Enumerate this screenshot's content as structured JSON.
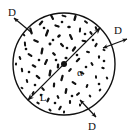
{
  "figure": {
    "type": "technical-diagram",
    "background_color": "#ffffff",
    "stroke_color": "#111111"
  },
  "circle": {
    "name": "specimen-cross-section",
    "center_x": 64,
    "center_y": 64,
    "radius": 51,
    "stroke_width": 1.4
  },
  "diagonal": {
    "name": "diameter-line",
    "label": "L",
    "x1": 27.9,
    "y1": 100.1,
    "x2": 100.1,
    "y2": 27.9,
    "angle_deg": 45,
    "arrowheads": "both"
  },
  "center_dot": {
    "name": "center-point",
    "radius": 3
  },
  "labels": {
    "diameter_label": "L",
    "angle_label": "α",
    "callout_top_left": "D",
    "callout_top_right": "D",
    "callout_bottom_right": "D"
  },
  "callouts": [
    {
      "id": "callout-top-left",
      "label": "D",
      "label_x": 12,
      "label_y": 16,
      "arrow_x1": 14,
      "arrow_y1": 18,
      "arrow_x2": 32,
      "arrow_y2": 33,
      "double_headed": false
    },
    {
      "id": "callout-top-right",
      "label": "D",
      "label_x": 118,
      "label_y": 34,
      "arrow_x1": 103,
      "arrow_y1": 48,
      "arrow_x2": 127,
      "arrow_y2": 39,
      "double_headed": true
    },
    {
      "id": "callout-bottom-right",
      "label": "D",
      "label_x": 92,
      "label_y": 130,
      "arrow_x1": 80,
      "arrow_y1": 100,
      "arrow_x2": 96,
      "arrow_y2": 117,
      "double_headed": true
    }
  ],
  "fibers": {
    "name": "scattered-fiber-marks",
    "count": 84,
    "color": "#111111",
    "marks": [
      {
        "x": 52,
        "y": 17,
        "len": 6.5,
        "w": 2.2,
        "a": 62
      },
      {
        "x": 64,
        "y": 16,
        "len": 5.0,
        "w": 2.0,
        "a": 15
      },
      {
        "x": 75,
        "y": 18,
        "len": 6.0,
        "w": 2.4,
        "a": 105
      },
      {
        "x": 86,
        "y": 22,
        "len": 4.5,
        "w": 2.0,
        "a": 40
      },
      {
        "x": 41,
        "y": 23,
        "len": 6.0,
        "w": 2.2,
        "a": 130
      },
      {
        "x": 31,
        "y": 31,
        "len": 7.0,
        "w": 2.3,
        "a": 75
      },
      {
        "x": 57,
        "y": 26,
        "len": 5.5,
        "w": 2.1,
        "a": 20
      },
      {
        "x": 69,
        "y": 27,
        "len": 3.5,
        "w": 2.6,
        "a": 0
      },
      {
        "x": 80,
        "y": 30,
        "len": 5.0,
        "w": 2.0,
        "a": 95
      },
      {
        "x": 91,
        "y": 33,
        "len": 4.0,
        "w": 2.2,
        "a": 55
      },
      {
        "x": 47,
        "y": 33,
        "len": 7.5,
        "w": 2.4,
        "a": 110
      },
      {
        "x": 36,
        "y": 41,
        "len": 6.0,
        "w": 2.2,
        "a": 25
      },
      {
        "x": 25,
        "y": 44,
        "len": 5.0,
        "w": 2.0,
        "a": 85
      },
      {
        "x": 59,
        "y": 36,
        "len": 4.0,
        "w": 2.6,
        "a": 140
      },
      {
        "x": 71,
        "y": 37,
        "len": 6.5,
        "w": 2.2,
        "a": 65
      },
      {
        "x": 84,
        "y": 41,
        "len": 5.0,
        "w": 2.1,
        "a": 10
      },
      {
        "x": 96,
        "y": 45,
        "len": 4.5,
        "w": 2.2,
        "a": 120
      },
      {
        "x": 50,
        "y": 44,
        "len": 3.0,
        "w": 2.8,
        "a": 0
      },
      {
        "x": 42,
        "y": 51,
        "len": 7.0,
        "w": 2.3,
        "a": 100
      },
      {
        "x": 30,
        "y": 55,
        "len": 5.5,
        "w": 2.1,
        "a": 35
      },
      {
        "x": 20,
        "y": 58,
        "len": 4.0,
        "w": 2.0,
        "a": 70
      },
      {
        "x": 62,
        "y": 45,
        "len": 5.0,
        "w": 2.2,
        "a": 50
      },
      {
        "x": 74,
        "y": 49,
        "len": 6.0,
        "w": 2.3,
        "a": 125
      },
      {
        "x": 88,
        "y": 52,
        "len": 4.0,
        "w": 2.1,
        "a": 15
      },
      {
        "x": 99,
        "y": 57,
        "len": 3.5,
        "w": 2.0,
        "a": 90
      },
      {
        "x": 54,
        "y": 54,
        "len": 4.5,
        "w": 2.4,
        "a": 45
      },
      {
        "x": 46,
        "y": 62,
        "len": 6.5,
        "w": 2.2,
        "a": 115
      },
      {
        "x": 34,
        "y": 66,
        "len": 5.0,
        "w": 2.1,
        "a": 30
      },
      {
        "x": 22,
        "y": 70,
        "len": 4.5,
        "w": 2.0,
        "a": 80
      },
      {
        "x": 66,
        "y": 58,
        "len": 3.0,
        "w": 2.6,
        "a": 0
      },
      {
        "x": 78,
        "y": 60,
        "len": 5.5,
        "w": 2.2,
        "a": 135
      },
      {
        "x": 92,
        "y": 64,
        "len": 4.0,
        "w": 2.1,
        "a": 60
      },
      {
        "x": 103,
        "y": 68,
        "len": 3.5,
        "w": 2.0,
        "a": 20
      },
      {
        "x": 58,
        "y": 66,
        "len": 5.0,
        "w": 2.3,
        "a": 95
      },
      {
        "x": 50,
        "y": 73,
        "len": 7.0,
        "w": 2.4,
        "a": 100
      },
      {
        "x": 38,
        "y": 77,
        "len": 5.5,
        "w": 2.2,
        "a": 40
      },
      {
        "x": 27,
        "y": 81,
        "len": 4.0,
        "w": 2.0,
        "a": 75
      },
      {
        "x": 70,
        "y": 70,
        "len": 4.5,
        "w": 2.2,
        "a": 130
      },
      {
        "x": 82,
        "y": 73,
        "len": 5.0,
        "w": 2.1,
        "a": 25
      },
      {
        "x": 96,
        "y": 77,
        "len": 3.5,
        "w": 2.0,
        "a": 85
      },
      {
        "x": 62,
        "y": 78,
        "len": 6.5,
        "w": 2.3,
        "a": 105
      },
      {
        "x": 54,
        "y": 85,
        "len": 5.0,
        "w": 2.2,
        "a": 95
      },
      {
        "x": 43,
        "y": 89,
        "len": 4.5,
        "w": 2.1,
        "a": 50
      },
      {
        "x": 33,
        "y": 93,
        "len": 4.0,
        "w": 2.0,
        "a": 120
      },
      {
        "x": 74,
        "y": 83,
        "len": 5.5,
        "w": 2.2,
        "a": 35
      },
      {
        "x": 87,
        "y": 86,
        "len": 4.0,
        "w": 2.1,
        "a": 110
      },
      {
        "x": 66,
        "y": 91,
        "len": 6.0,
        "w": 2.3,
        "a": 100
      },
      {
        "x": 58,
        "y": 97,
        "len": 4.0,
        "w": 2.1,
        "a": 65
      },
      {
        "x": 48,
        "y": 100,
        "len": 5.0,
        "w": 2.2,
        "a": 115
      },
      {
        "x": 38,
        "y": 103,
        "len": 3.5,
        "w": 2.0,
        "a": 30
      },
      {
        "x": 78,
        "y": 94,
        "len": 4.5,
        "w": 2.2,
        "a": 140
      },
      {
        "x": 90,
        "y": 96,
        "len": 3.0,
        "w": 2.0,
        "a": 55
      },
      {
        "x": 70,
        "y": 102,
        "len": 4.0,
        "w": 2.1,
        "a": 90
      },
      {
        "x": 60,
        "y": 108,
        "len": 5.0,
        "w": 2.2,
        "a": 120
      },
      {
        "x": 50,
        "y": 110,
        "len": 3.5,
        "w": 2.0,
        "a": 45
      },
      {
        "x": 80,
        "y": 105,
        "len": 3.0,
        "w": 2.0,
        "a": 80
      },
      {
        "x": 44,
        "y": 14,
        "len": 3.0,
        "w": 2.0,
        "a": 90
      },
      {
        "x": 96,
        "y": 28,
        "len": 3.5,
        "w": 2.1,
        "a": 70
      },
      {
        "x": 24,
        "y": 35,
        "len": 3.0,
        "w": 2.0,
        "a": 45
      },
      {
        "x": 104,
        "y": 50,
        "len": 3.0,
        "w": 2.0,
        "a": 15
      },
      {
        "x": 16,
        "y": 64,
        "len": 3.0,
        "w": 2.0,
        "a": 100
      },
      {
        "x": 107,
        "y": 78,
        "len": 3.0,
        "w": 2.0,
        "a": 60
      },
      {
        "x": 22,
        "y": 88,
        "len": 3.0,
        "w": 2.0,
        "a": 35
      },
      {
        "x": 100,
        "y": 90,
        "len": 3.0,
        "w": 2.0,
        "a": 125
      },
      {
        "x": 32,
        "y": 106,
        "len": 3.0,
        "w": 2.0,
        "a": 70
      },
      {
        "x": 88,
        "y": 110,
        "len": 3.0,
        "w": 2.0,
        "a": 20
      },
      {
        "x": 64,
        "y": 112,
        "len": 3.0,
        "w": 2.0,
        "a": 95
      },
      {
        "x": 53,
        "y": 40,
        "len": 2.6,
        "w": 2.4,
        "a": 0
      },
      {
        "x": 77,
        "y": 55,
        "len": 2.6,
        "w": 2.4,
        "a": 0
      },
      {
        "x": 39,
        "y": 60,
        "len": 2.6,
        "w": 2.4,
        "a": 0
      },
      {
        "x": 86,
        "y": 67,
        "len": 2.6,
        "w": 2.4,
        "a": 0
      },
      {
        "x": 29,
        "y": 72,
        "len": 2.6,
        "w": 2.4,
        "a": 0
      },
      {
        "x": 67,
        "y": 48,
        "len": 2.6,
        "w": 2.4,
        "a": 0
      },
      {
        "x": 44,
        "y": 28,
        "len": 2.6,
        "w": 2.4,
        "a": 0
      },
      {
        "x": 93,
        "y": 40,
        "len": 2.6,
        "w": 2.4,
        "a": 0
      },
      {
        "x": 56,
        "y": 60,
        "len": 2.6,
        "w": 2.4,
        "a": 0
      },
      {
        "x": 72,
        "y": 96,
        "len": 2.6,
        "w": 2.4,
        "a": 0
      },
      {
        "x": 41,
        "y": 95,
        "len": 2.6,
        "w": 2.4,
        "a": 0
      },
      {
        "x": 99,
        "y": 84,
        "len": 2.6,
        "w": 2.4,
        "a": 0
      },
      {
        "x": 26,
        "y": 49,
        "len": 2.6,
        "w": 2.4,
        "a": 0
      },
      {
        "x": 85,
        "y": 34,
        "len": 2.6,
        "w": 2.4,
        "a": 0
      },
      {
        "x": 62,
        "y": 22,
        "len": 2.6,
        "w": 2.4,
        "a": 0
      },
      {
        "x": 35,
        "y": 85,
        "len": 2.6,
        "w": 2.4,
        "a": 0
      },
      {
        "x": 104,
        "y": 61,
        "len": 2.6,
        "w": 2.4,
        "a": 0
      },
      {
        "x": 55,
        "y": 103,
        "len": 2.6,
        "w": 2.4,
        "a": 0
      }
    ]
  },
  "label_positions": {
    "L": {
      "x": 43,
      "y": 101
    },
    "alpha": {
      "x": 80,
      "y": 76
    }
  }
}
